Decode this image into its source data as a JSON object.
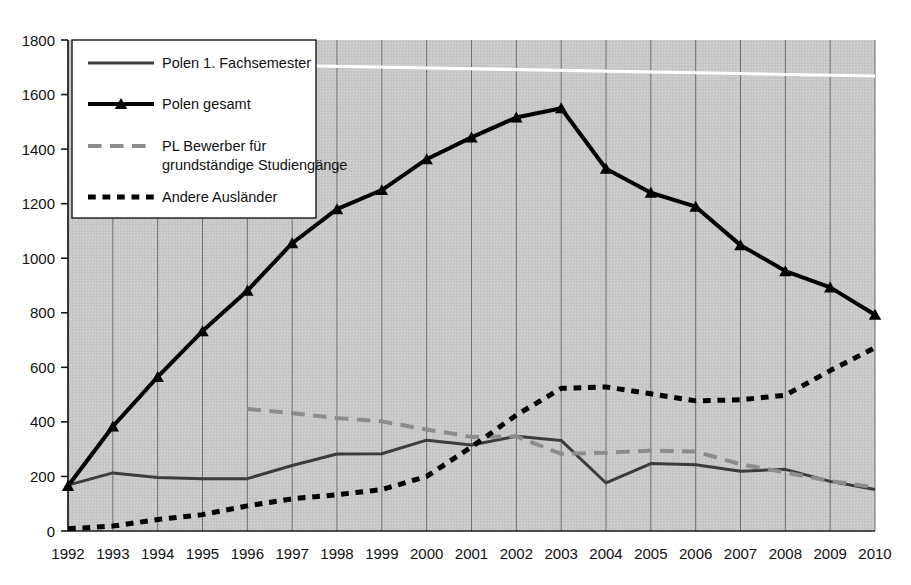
{
  "chart_data": {
    "type": "line",
    "title": "",
    "subtitle": "",
    "xlabel": "",
    "ylabel": "",
    "x": [
      1992,
      1993,
      1994,
      1995,
      1996,
      1997,
      1998,
      1999,
      2000,
      2001,
      2002,
      2003,
      2004,
      2005,
      2006,
      2007,
      2008,
      2009,
      2010
    ],
    "categories": [
      "1992",
      "1993",
      "1994",
      "1995",
      "1996",
      "1997",
      "1998",
      "1999",
      "2000",
      "2001",
      "2002",
      "2003",
      "2004",
      "2005",
      "2006",
      "2007",
      "2008",
      "2009",
      "2010"
    ],
    "xlim": [
      1992,
      2010
    ],
    "ylim": [
      0,
      1800
    ],
    "ytick_step": 200,
    "yticks": [
      0,
      200,
      400,
      600,
      800,
      1000,
      1200,
      1400,
      1600,
      1800
    ],
    "ytick_labels": [
      "0",
      "200",
      "400",
      "600",
      "800",
      "1000",
      "1200",
      "1400",
      "1600",
      "1800"
    ],
    "grid": "vertical",
    "legend_position": "top-left",
    "plot_background": "#c8c8c8",
    "series": [
      {
        "name": "Polen 1. Fachsemester",
        "style": "solid",
        "color": "#3c3c3c",
        "marker": "none",
        "width": 3,
        "values": [
          168,
          213,
          196,
          192,
          192,
          240,
          282,
          283,
          333,
          315,
          347,
          332,
          176,
          247,
          243,
          219,
          226,
          182,
          152
        ]
      },
      {
        "name": "Polen gesamt",
        "style": "solid",
        "color": "#000000",
        "marker": "triangle",
        "width": 4,
        "values": [
          165,
          383,
          565,
          733,
          881,
          1055,
          1180,
          1250,
          1363,
          1443,
          1516,
          1550,
          1328,
          1240,
          1189,
          1048,
          953,
          893,
          793
        ]
      },
      {
        "name": "PL Bewerber für grundständige Studiengänge",
        "style": "dashed",
        "color": "#8c8c8c",
        "marker": "none",
        "width": 4,
        "values": [
          null,
          null,
          null,
          null,
          447,
          432,
          414,
          402,
          372,
          345,
          347,
          283,
          287,
          295,
          291,
          245,
          215,
          183,
          160
        ]
      },
      {
        "name": "Andere Ausländer",
        "style": "dotted",
        "color": "#000000",
        "marker": "none",
        "width": 5,
        "values": [
          8,
          18,
          42,
          60,
          92,
          118,
          133,
          152,
          200,
          308,
          425,
          523,
          528,
          503,
          477,
          481,
          498,
          588,
          672
        ]
      }
    ],
    "legend": [
      {
        "label": "Polen 1. Fachsemester",
        "style": "solid",
        "color": "#3c3c3c",
        "marker": "none"
      },
      {
        "label": "Polen gesamt",
        "style": "solid",
        "color": "#000000",
        "marker": "triangle"
      },
      {
        "label": "PL Bewerber für",
        "label2": "grundständige Studiengänge",
        "style": "dashed",
        "color": "#8c8c8c",
        "marker": "none"
      },
      {
        "label": "Andere Ausländer",
        "style": "dotted",
        "color": "#000000",
        "marker": "none"
      }
    ],
    "annotations": [
      {
        "kind": "scan-artifact",
        "description": "white horizontal scan line across upper plot area"
      }
    ]
  }
}
